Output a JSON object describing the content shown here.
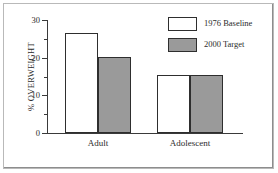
{
  "chart_data": {
    "type": "bar",
    "title": "",
    "xlabel": "",
    "ylabel": "% OVERWEIGHT",
    "categories": [
      "Adult",
      "Adolescent"
    ],
    "series": [
      {
        "name": "1976 Baseline",
        "values": [
          26.5,
          15.5
        ],
        "color": "#ffffff"
      },
      {
        "name": "2000 Target",
        "values": [
          20.3,
          15.5
        ],
        "color": "#9a9a9a"
      }
    ],
    "ylim": [
      0,
      30
    ],
    "yticks": [
      0,
      10,
      20,
      30
    ],
    "ytick_labels": [
      "0",
      "10",
      "20",
      "30"
    ],
    "yminor_ticks": [
      5,
      15,
      25
    ],
    "grid": false,
    "legend_position": "top-right"
  },
  "axis": {
    "y_title": "% OVERWEIGHT",
    "labels": {
      "t0": "0",
      "t10": "10",
      "t20": "20",
      "t30": "30"
    }
  },
  "groups": {
    "adult": "Adult",
    "adolescent": "Adolescent"
  },
  "legend": {
    "baseline_label": "1976 Baseline",
    "target_label": "2000 Target"
  },
  "colors": {
    "baseline_fill": "#ffffff",
    "target_fill": "#9a9a9a",
    "outline": "#2e2e2e",
    "axis": "#3a3a3a",
    "frame": "#b9b9b9"
  }
}
